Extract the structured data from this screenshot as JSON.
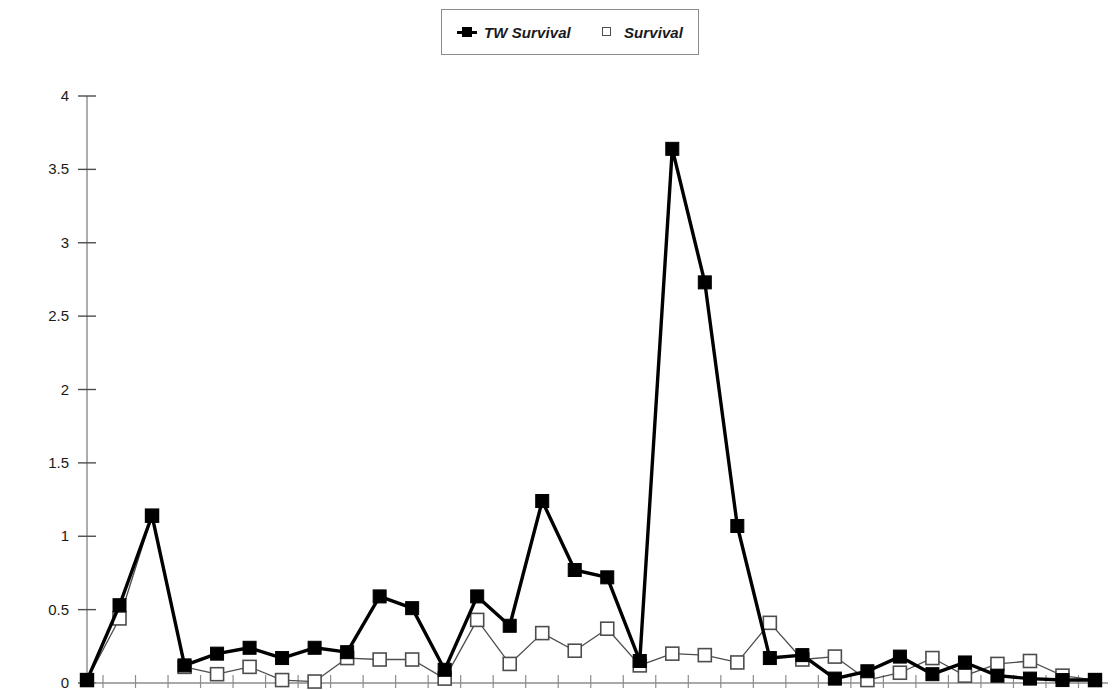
{
  "legend": {
    "position": "top-center",
    "entries": [
      {
        "label": "TW Survival",
        "marker": "filled-square",
        "color": "#000000",
        "has_line": true
      },
      {
        "label": "Survival",
        "marker": "open-square",
        "color": "#4d4d4d",
        "has_line": false
      }
    ]
  },
  "axes": {
    "y_tick_labels": [
      "4",
      "3.5",
      "3",
      "2.5",
      "2",
      "1.5",
      "1",
      "0.5",
      "0"
    ],
    "x_tick_labels": []
  },
  "chart_data": {
    "type": "line",
    "title": "",
    "xlabel": "",
    "ylabel": "",
    "ylim": [
      0,
      4
    ],
    "ytick_values": [
      0,
      0.5,
      1,
      1.5,
      2,
      2.5,
      3,
      3.5,
      4
    ],
    "grid": false,
    "legend_position": "top-center",
    "x": [
      1,
      2,
      3,
      4,
      5,
      6,
      7,
      8,
      9,
      10,
      11,
      12,
      13,
      14,
      15,
      16,
      17,
      18,
      19,
      20,
      21,
      22,
      23,
      24,
      25,
      26,
      27,
      28,
      29,
      30,
      31,
      32
    ],
    "series": [
      {
        "name": "TW Survival",
        "marker": "filled-square",
        "color": "#000000",
        "values": [
          0.02,
          0.53,
          1.14,
          0.12,
          0.2,
          0.24,
          0.17,
          0.24,
          0.21,
          0.59,
          0.51,
          0.09,
          0.59,
          0.39,
          1.24,
          0.77,
          0.72,
          0.15,
          3.64,
          2.73,
          1.07,
          0.17,
          0.19,
          0.03,
          0.08,
          0.18,
          0.06,
          0.14,
          0.05,
          0.03,
          0.02,
          0.02
        ]
      },
      {
        "name": "Survival",
        "marker": "open-square",
        "color": "#4d4d4d",
        "values": [
          0.02,
          0.44,
          1.14,
          0.11,
          0.06,
          0.11,
          0.02,
          0.01,
          0.17,
          0.16,
          0.16,
          0.03,
          0.43,
          0.13,
          0.34,
          0.22,
          0.37,
          0.12,
          0.2,
          0.19,
          0.14,
          0.41,
          0.16,
          0.18,
          0.02,
          0.07,
          0.17,
          0.05,
          0.13,
          0.15,
          0.05,
          0.02
        ]
      }
    ]
  }
}
